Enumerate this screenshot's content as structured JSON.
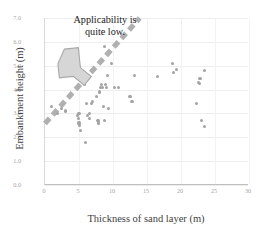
{
  "chart_data": {
    "type": "scatter",
    "title": "",
    "xlabel": "Thickness of sand layer (m)",
    "ylabel": "Embankment height (m)",
    "xlim": [
      0,
      30
    ],
    "ylim": [
      0.0,
      7.0
    ],
    "xticks": [
      "0",
      "5",
      "10",
      "15",
      "20",
      "25",
      "30"
    ],
    "yticks": [
      "0.0",
      "1.0",
      "2.0",
      "3.0",
      "4.0",
      "5.0",
      "6.0",
      "7.0"
    ],
    "xtick_values": [
      0,
      5,
      10,
      15,
      20,
      25,
      30
    ],
    "ytick_values": [
      0.0,
      1.0,
      2.0,
      3.0,
      4.0,
      5.0,
      6.0,
      7.0
    ],
    "grid": "horizontal-and-vertical-faint",
    "legend": "none",
    "point_color": "#a3a3a3",
    "trend_color": "#b0b0b0",
    "series": [
      {
        "name": "Embankment cases",
        "points": [
          [
            1.0,
            3.3
          ],
          [
            1.8,
            3.0
          ],
          [
            2.4,
            3.2
          ],
          [
            3.0,
            3.1
          ],
          [
            4.8,
            2.9
          ],
          [
            4.9,
            2.8
          ],
          [
            5.0,
            3.0
          ],
          [
            5.0,
            2.6
          ],
          [
            5.1,
            2.5
          ],
          [
            5.2,
            2.3
          ],
          [
            5.6,
            4.3
          ],
          [
            5.7,
            4.4
          ],
          [
            5.8,
            4.2
          ],
          [
            6.0,
            1.8
          ],
          [
            6.1,
            3.4
          ],
          [
            6.3,
            2.9
          ],
          [
            6.5,
            3.0
          ],
          [
            6.6,
            2.8
          ],
          [
            6.8,
            3.4
          ],
          [
            7.0,
            3.5
          ],
          [
            7.6,
            3.7
          ],
          [
            7.8,
            2.7
          ],
          [
            7.9,
            2.6
          ],
          [
            8.0,
            3.9
          ],
          [
            8.2,
            4.1
          ],
          [
            8.3,
            4.2
          ],
          [
            8.5,
            4.1
          ],
          [
            8.6,
            3.3
          ],
          [
            8.7,
            2.7
          ],
          [
            8.8,
            5.8
          ],
          [
            8.9,
            4.2
          ],
          [
            9.0,
            4.1
          ],
          [
            9.2,
            4.6
          ],
          [
            9.4,
            3.2
          ],
          [
            9.8,
            5.1
          ],
          [
            10.2,
            4.1
          ],
          [
            10.8,
            4.1
          ],
          [
            12.5,
            3.7
          ],
          [
            12.8,
            3.5
          ],
          [
            13.2,
            4.6
          ],
          [
            16.5,
            4.55
          ],
          [
            18.8,
            5.1
          ],
          [
            18.9,
            4.7
          ],
          [
            19.3,
            4.85
          ],
          [
            22.3,
            3.4
          ],
          [
            22.6,
            4.3
          ],
          [
            22.7,
            4.25
          ],
          [
            22.8,
            4.45
          ],
          [
            23.0,
            2.7
          ],
          [
            23.4,
            4.8
          ],
          [
            23.5,
            2.45
          ]
        ]
      }
    ],
    "trend_line": {
      "style": "dashed-thick",
      "x_start": 0.0,
      "y_start": 2.55,
      "x_end": 14.0,
      "y_end": 7.0
    },
    "annotations": [
      {
        "name": "applicability-note",
        "text_line_1": "Applicability is",
        "text_line_2": "quite low.",
        "arrow": "up-left-block-arrow",
        "arrow_fill": "#d4d4d4",
        "arrow_stroke": "#9e9e9e"
      }
    ]
  },
  "axes": {
    "x_title": "Thickness of sand layer (m)",
    "y_title": "Embankment height (m)"
  },
  "annotation": {
    "line1": "Applicability is",
    "line2": "quite low."
  }
}
